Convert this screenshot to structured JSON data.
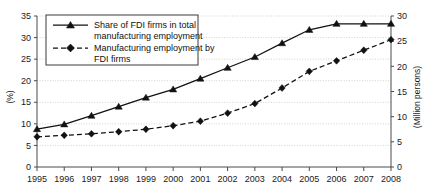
{
  "chart_data": {
    "type": "line",
    "title": "",
    "xlabel": "",
    "ylabel": "(%)",
    "y2label": "(Million persons)",
    "categories": [
      "1995",
      "1996",
      "1997",
      "1998",
      "1999",
      "2000",
      "2001",
      "2002",
      "2003",
      "2004",
      "2005",
      "2006",
      "2007",
      "2008"
    ],
    "ylim": [
      0,
      35
    ],
    "y2lim": [
      0,
      30
    ],
    "yticks": [
      0,
      5,
      10,
      15,
      20,
      25,
      30,
      35
    ],
    "y2ticks": [
      0,
      5,
      10,
      15,
      20,
      25,
      30
    ],
    "grid": true,
    "legend_position": "upper-left",
    "series": [
      {
        "name": "Share of FDI firms in total manufacturing employment",
        "axis": "left",
        "style": "solid",
        "marker": "triangle",
        "values": [
          8.8,
          9.9,
          11.9,
          14.0,
          16.1,
          18.0,
          20.5,
          23.0,
          25.5,
          28.7,
          31.8,
          33.2,
          33.2,
          33.2
        ]
      },
      {
        "name": "Manufacturing employment by FDI firms",
        "axis": "right",
        "style": "dashed",
        "marker": "diamond",
        "values": [
          6.0,
          6.3,
          6.6,
          7.0,
          7.5,
          8.2,
          9.1,
          10.7,
          12.6,
          15.7,
          19.0,
          21.1,
          23.2,
          25.3
        ]
      }
    ]
  },
  "axes": {
    "left_title": "(%)",
    "right_title": "(Million persons)",
    "left_ticks": [
      "0",
      "5",
      "10",
      "15",
      "20",
      "25",
      "30",
      "35"
    ],
    "right_ticks": [
      "0",
      "5",
      "10",
      "15",
      "20",
      "25",
      "30"
    ],
    "x_ticks": [
      "1995",
      "1996",
      "1997",
      "1998",
      "1999",
      "2000",
      "2001",
      "2002",
      "2003",
      "2004",
      "2005",
      "2006",
      "2007",
      "2008"
    ]
  },
  "legend": {
    "entries": [
      {
        "line1": "Share of FDI firms in total",
        "line2": "manufacturing employment",
        "marker": "triangle-marker",
        "style": "solid"
      },
      {
        "line1": "Manufacturing employment by",
        "line2": "FDI firms",
        "marker": "diamond-marker",
        "style": "dashed"
      }
    ]
  },
  "colors": {
    "series": "#111111",
    "grid": "#bdbdbd",
    "axis": "#4a4a4a",
    "background": "#ffffff"
  }
}
